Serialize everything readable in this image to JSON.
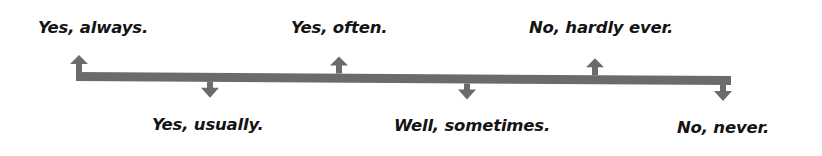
{
  "diagram": {
    "arrow_color": "#6b6b6b",
    "text_color": "#141414",
    "bar": {
      "x1": 76,
      "y1_left": 76.5,
      "x2": 731,
      "y2_right": 80.5,
      "thickness": 9
    },
    "labels": [
      {
        "text": "Yes, always.",
        "position": "above",
        "arrow_x": 79,
        "label_x": 38,
        "label_y": 20,
        "width": 119
      },
      {
        "text": "Yes, usually.",
        "position": "below",
        "arrow_x": 210,
        "label_x": 152,
        "label_y": 117,
        "width": 118
      },
      {
        "text": "Yes, often.",
        "position": "above",
        "arrow_x": 339,
        "label_x": 291,
        "label_y": 20,
        "width": 98
      },
      {
        "text": "Well, sometimes.",
        "position": "below",
        "arrow_x": 467,
        "label_x": 394,
        "label_y": 118,
        "width": 162
      },
      {
        "text": "No, hardly ever.",
        "position": "above",
        "arrow_x": 595,
        "label_x": 529,
        "label_y": 20,
        "width": 161
      },
      {
        "text": "No, never.",
        "position": "below",
        "arrow_x": 723,
        "label_x": 677,
        "label_y": 120,
        "width": 99
      }
    ]
  }
}
